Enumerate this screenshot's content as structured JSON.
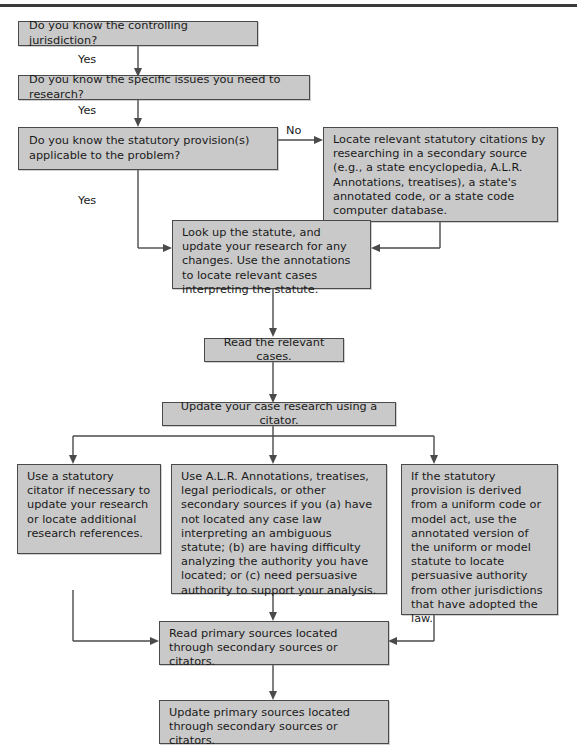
{
  "diagram": {
    "accent_color": "#c9c9c9",
    "border_color": "#4a4a4a",
    "text_color": "#1a1a1a",
    "background": "#ffffff"
  },
  "nodes": {
    "jurisdiction": "Do you know the controlling jurisdiction?",
    "specific_issues": "Do you know the specific issues you need to research?",
    "statutory_provision": "Do you know the statutory provision(s) applicable to the problem?",
    "locate_citations": "Locate relevant statutory citations by researching in a secondary source (e.g., a state encyclopedia, A.L.R. Annotations, treatises), a state's annotated code, or a state code computer database.",
    "look_up_statute": "Look up the statute, and update your research for any changes. Use the annotations to locate relevant cases interpreting the statute.",
    "read_cases": "Read the relevant cases.",
    "update_case_research": "Update your case research using a citator.",
    "statutory_citator": "Use a statutory citator if necessary to update your research or locate additional research references.",
    "alr_annotations": "Use A.L.R. Annotations, treatises, legal periodicals, or other secondary sources if you (a) have not located any case law interpreting an ambiguous statute; (b) are having difficulty analyzing the authority you have located; or (c) need persuasive authority to support your analysis.",
    "uniform_code": "If the statutory provision is derived from a uniform code or model act, use the annotated version of the uniform or model statute to locate persuasive authority from other jurisdictions that have adopted the law.",
    "read_primary_sources": "Read primary sources located through secondary sources or citators.",
    "update_primary_sources": "Update primary sources located through secondary sources or citators."
  },
  "edge_labels": {
    "yes_1": "Yes",
    "yes_2": "Yes",
    "yes_3": "Yes",
    "no_1": "No"
  }
}
